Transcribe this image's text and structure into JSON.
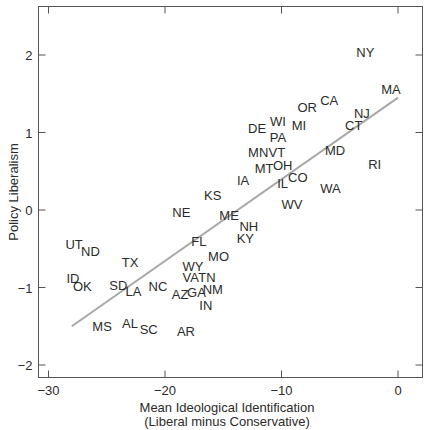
{
  "chart_data": {
    "type": "scatter",
    "title": "",
    "xlabel": "Mean Ideological Identification",
    "xlabel_sub": "(Liberal minus Conservative)",
    "ylabel": "Policy Liberalism",
    "xlim": [
      -31,
      2
    ],
    "ylim": [
      -2.2,
      2.6
    ],
    "xticks": [
      -30,
      -20,
      -10,
      0
    ],
    "xtick_labels": [
      "−30",
      "−20",
      "−10",
      "0"
    ],
    "yticks": [
      2,
      1,
      0,
      -1,
      -2
    ],
    "ytick_labels": [
      "2",
      "1",
      "0",
      "−1",
      "−2"
    ],
    "grid": false,
    "legend": null,
    "marker": "state-abbreviation-text",
    "fit_line": {
      "x": [
        -28,
        0
      ],
      "y": [
        -1.5,
        1.45
      ],
      "color": "#a8a8a8"
    },
    "points": [
      {
        "label": "NY",
        "x": -2.8,
        "y": 2.04
      },
      {
        "label": "MA",
        "x": -0.6,
        "y": 1.56
      },
      {
        "label": "CA",
        "x": -5.9,
        "y": 1.42
      },
      {
        "label": "OR",
        "x": -7.8,
        "y": 1.33
      },
      {
        "label": "NJ",
        "x": -3.1,
        "y": 1.25
      },
      {
        "label": "WI",
        "x": -10.3,
        "y": 1.15
      },
      {
        "label": "MI",
        "x": -8.5,
        "y": 1.1
      },
      {
        "label": "CT",
        "x": -3.8,
        "y": 1.1
      },
      {
        "label": "DE",
        "x": -12.1,
        "y": 1.06
      },
      {
        "label": "PA",
        "x": -10.3,
        "y": 0.94
      },
      {
        "label": "MN",
        "x": -12.0,
        "y": 0.75
      },
      {
        "label": "VT",
        "x": -10.4,
        "y": 0.75
      },
      {
        "label": "MD",
        "x": -5.4,
        "y": 0.77
      },
      {
        "label": "MT",
        "x": -11.5,
        "y": 0.54
      },
      {
        "label": "OH",
        "x": -9.9,
        "y": 0.58
      },
      {
        "label": "RI",
        "x": -2.0,
        "y": 0.59
      },
      {
        "label": "IA",
        "x": -13.3,
        "y": 0.39
      },
      {
        "label": "CO",
        "x": -8.6,
        "y": 0.43
      },
      {
        "label": "IL",
        "x": -9.9,
        "y": 0.35
      },
      {
        "label": "WA",
        "x": -5.8,
        "y": 0.28
      },
      {
        "label": "KS",
        "x": -15.9,
        "y": 0.19
      },
      {
        "label": "WV",
        "x": -9.1,
        "y": 0.08
      },
      {
        "label": "NE",
        "x": -18.6,
        "y": -0.03
      },
      {
        "label": "ME",
        "x": -14.5,
        "y": -0.06
      },
      {
        "label": "NH",
        "x": -12.8,
        "y": -0.21
      },
      {
        "label": "KY",
        "x": -13.1,
        "y": -0.36
      },
      {
        "label": "FL",
        "x": -17.1,
        "y": -0.4
      },
      {
        "label": "UT",
        "x": -27.8,
        "y": -0.44
      },
      {
        "label": "ND",
        "x": -26.4,
        "y": -0.53
      },
      {
        "label": "MO",
        "x": -15.4,
        "y": -0.59
      },
      {
        "label": "TX",
        "x": -23.0,
        "y": -0.67
      },
      {
        "label": "WY",
        "x": -17.6,
        "y": -0.72
      },
      {
        "label": "ID",
        "x": -27.9,
        "y": -0.88
      },
      {
        "label": "VA",
        "x": -17.8,
        "y": -0.86
      },
      {
        "label": "TN",
        "x": -16.4,
        "y": -0.86
      },
      {
        "label": "OK",
        "x": -27.1,
        "y": -0.98
      },
      {
        "label": "SD",
        "x": -24.0,
        "y": -0.97
      },
      {
        "label": "LA",
        "x": -22.7,
        "y": -1.05
      },
      {
        "label": "NC",
        "x": -20.6,
        "y": -0.98
      },
      {
        "label": "AZ",
        "x": -18.7,
        "y": -1.08
      },
      {
        "label": "GA",
        "x": -17.3,
        "y": -1.06
      },
      {
        "label": "NM",
        "x": -15.9,
        "y": -1.02
      },
      {
        "label": "IN",
        "x": -16.5,
        "y": -1.23
      },
      {
        "label": "MS",
        "x": -25.4,
        "y": -1.5
      },
      {
        "label": "AL",
        "x": -23.0,
        "y": -1.46
      },
      {
        "label": "SC",
        "x": -21.4,
        "y": -1.54
      },
      {
        "label": "AR",
        "x": -18.2,
        "y": -1.56
      }
    ]
  },
  "colors": {
    "axis": "#555555",
    "text": "#2b2b2b",
    "fit_line": "#a8a8a8",
    "background": "#ffffff"
  }
}
